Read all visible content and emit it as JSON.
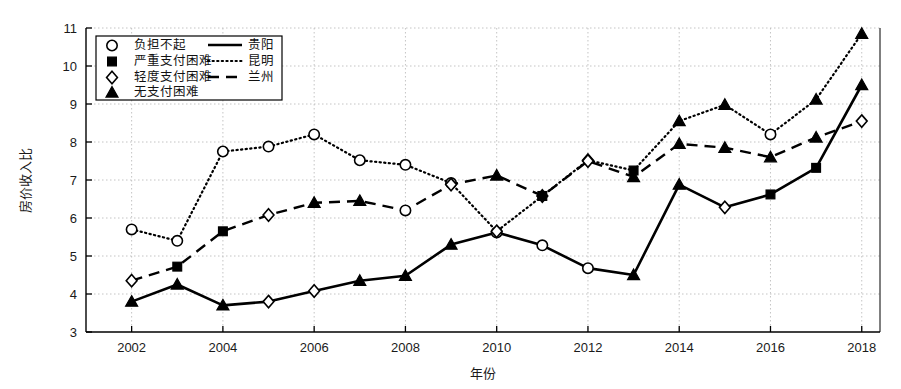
{
  "chart_data": {
    "type": "line",
    "title": "",
    "xlabel": "年份",
    "ylabel": "房价收入比",
    "xlim": [
      2001.0,
      2018.4
    ],
    "ylim": [
      3,
      11
    ],
    "grid": true,
    "xticks": [
      2002,
      2004,
      2006,
      2008,
      2010,
      2012,
      2014,
      2016,
      2018
    ],
    "yticks": [
      3,
      4,
      5,
      6,
      7,
      8,
      9,
      10,
      11
    ],
    "x": [
      2002,
      2003,
      2004,
      2005,
      2006,
      2007,
      2008,
      2009,
      2010,
      2011,
      2012,
      2013,
      2014,
      2015,
      2016,
      2017,
      2018
    ],
    "legend_position": "upper-left",
    "marker_legend": [
      {
        "marker": "circle-open",
        "label": "负担不起"
      },
      {
        "marker": "square-filled",
        "label": "严重支付困难"
      },
      {
        "marker": "diamond-open",
        "label": "轻度支付困难"
      },
      {
        "marker": "triangle-filled",
        "label": "无支付困难"
      }
    ],
    "line_legend": [
      {
        "style": "solid",
        "label": "贵阳"
      },
      {
        "style": "dotted",
        "label": "昆明"
      },
      {
        "style": "dashed",
        "label": "兰州"
      }
    ],
    "series": [
      {
        "name": "贵阳",
        "style": "solid",
        "values": [
          3.8,
          4.25,
          3.7,
          3.8,
          4.08,
          4.35,
          4.48,
          5.3,
          5.62,
          5.28,
          4.68,
          4.5,
          6.88,
          6.28,
          6.62,
          7.32,
          9.5
        ],
        "markers": [
          "triangle-filled",
          "triangle-filled",
          "triangle-filled",
          "diamond-open",
          "diamond-open",
          "triangle-filled",
          "triangle-filled",
          "triangle-filled",
          "circle-open",
          "circle-open",
          "circle-open",
          "triangle-filled",
          "triangle-filled",
          "diamond-open",
          "square-filled",
          "square-filled",
          "triangle-filled"
        ]
      },
      {
        "name": "昆明",
        "style": "dotted",
        "values": [
          5.7,
          5.4,
          7.75,
          7.88,
          8.2,
          7.52,
          7.4,
          6.92,
          5.65,
          6.58,
          7.52,
          7.25,
          8.55,
          8.98,
          8.2,
          9.12,
          10.85
        ],
        "markers": [
          "circle-open",
          "circle-open",
          "circle-open",
          "circle-open",
          "circle-open",
          "circle-open",
          "circle-open",
          "circle-open",
          "diamond-open",
          "diamond-open",
          "diamond-open",
          "square-filled",
          "triangle-filled",
          "triangle-filled",
          "circle-open",
          "triangle-filled",
          "triangle-filled"
        ]
      },
      {
        "name": "兰州",
        "style": "dashed",
        "values": [
          4.35,
          4.72,
          5.65,
          6.08,
          6.4,
          6.45,
          6.2,
          6.88,
          7.12,
          6.58,
          7.5,
          7.08,
          7.95,
          7.85,
          7.6,
          8.12,
          8.55
        ],
        "markers": [
          "diamond-open",
          "square-filled",
          "square-filled",
          "diamond-open",
          "triangle-filled",
          "triangle-filled",
          "circle-open",
          "diamond-open",
          "triangle-filled",
          "square-filled",
          "diamond-open",
          "triangle-filled",
          "triangle-filled",
          "triangle-filled",
          "triangle-filled",
          "triangle-filled",
          "diamond-open"
        ]
      }
    ]
  }
}
